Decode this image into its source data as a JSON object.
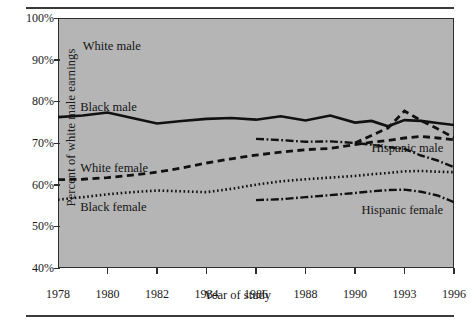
{
  "figure": {
    "top_rule": "",
    "bottom_rule": ""
  },
  "chart_data": {
    "type": "line",
    "title": "",
    "xlabel": "Year of study",
    "ylabel": "Percent of white male earnings",
    "xlim": [
      1978,
      1996
    ],
    "ylim": [
      40,
      100
    ],
    "ytick_labels": [
      "100%",
      "90%",
      "80%",
      "70%",
      "60%",
      "50%",
      "40%"
    ],
    "ytick_values": [
      100,
      90,
      80,
      70,
      60,
      50,
      40
    ],
    "xtick_labels": [
      "1978",
      "1980",
      "1982",
      "1984",
      "1986",
      "1988",
      "1990",
      "1993",
      "1996"
    ],
    "xtick_values": [
      1978,
      1980,
      1982,
      1984,
      1986,
      1988,
      1990,
      1993,
      1996
    ],
    "grid": false,
    "legend": "inline-annotations",
    "plot_background": "#b5b5b5",
    "series": [
      {
        "name": "White male",
        "style": "reference",
        "label": "White male",
        "label_x": 1979.0,
        "label_y": 93.0,
        "x": [],
        "values": []
      },
      {
        "name": "Black male",
        "style": "solid",
        "color": "#111111",
        "label": "Black male",
        "label_x": 1978.9,
        "label_y": 78.3,
        "x": [
          1978,
          1979,
          1980,
          1981,
          1982,
          1983,
          1984,
          1985,
          1986,
          1987,
          1988,
          1989,
          1990,
          1991,
          1992,
          1993,
          1994,
          1995,
          1996
        ],
        "values": [
          76.2,
          76.6,
          77.3,
          76.0,
          74.7,
          75.3,
          75.8,
          76.0,
          75.6,
          76.4,
          75.4,
          76.6,
          74.9,
          75.3,
          74.0,
          75.5,
          75.3,
          74.8,
          74.3
        ]
      },
      {
        "name": "White female",
        "style": "dashed",
        "color": "#111111",
        "label": "White female",
        "label_x": 1978.9,
        "label_y": 63.8,
        "x": [
          1978,
          1979,
          1980,
          1981,
          1982,
          1983,
          1984,
          1985,
          1986,
          1987,
          1988,
          1989,
          1990,
          1991,
          1992,
          1993,
          1994,
          1995,
          1996
        ],
        "values": [
          61.2,
          61.3,
          61.7,
          62.3,
          63.0,
          64.0,
          65.2,
          66.2,
          67.1,
          67.8,
          68.4,
          68.7,
          69.6,
          70.2,
          70.6,
          71.2,
          71.6,
          71.2,
          70.8
        ]
      },
      {
        "name": "Black female",
        "style": "dotted",
        "color": "#111111",
        "label": "Black female",
        "label_x": 1978.9,
        "label_y": 54.5,
        "x": [
          1978,
          1979,
          1980,
          1981,
          1982,
          1983,
          1984,
          1985,
          1986,
          1987,
          1988,
          1989,
          1990,
          1991,
          1992,
          1993,
          1994,
          1995,
          1996
        ],
        "values": [
          56.4,
          57.0,
          57.7,
          58.2,
          58.6,
          58.4,
          58.2,
          59.0,
          60.0,
          60.8,
          61.3,
          61.7,
          62.1,
          62.5,
          62.8,
          63.2,
          63.3,
          63.1,
          63.0
        ]
      },
      {
        "name": "Hispanic male",
        "style": "dash-dot",
        "color": "#111111",
        "label": "Hispanic male",
        "label_x": 1991.0,
        "label_y": 68.5,
        "x": [
          1986,
          1987,
          1988,
          1989,
          1990,
          1991,
          1992,
          1993,
          1994,
          1995,
          1996
        ],
        "values": [
          71.0,
          70.7,
          70.3,
          70.4,
          70.0,
          69.6,
          69.0,
          68.6,
          67.0,
          65.8,
          64.2
        ]
      },
      {
        "name": "Hispanic female",
        "style": "dash-dot",
        "color": "#111111",
        "label": "Hispanic female",
        "label_x": 1990.4,
        "label_y": 53.6,
        "x": [
          1986,
          1987,
          1988,
          1989,
          1990,
          1991,
          1992,
          1993,
          1994,
          1995,
          1996
        ],
        "values": [
          56.3,
          56.5,
          57.0,
          57.5,
          58.0,
          58.4,
          58.7,
          58.8,
          58.3,
          57.4,
          55.8
        ]
      },
      {
        "name": "Hispanic male peak",
        "style": "dashed",
        "color": "#111111",
        "label": "",
        "x": [
          1990,
          1991,
          1992,
          1993,
          1994,
          1995,
          1996
        ],
        "values": [
          70.0,
          71.8,
          73.6,
          77.7,
          75.4,
          73.4,
          71.3
        ]
      }
    ]
  }
}
